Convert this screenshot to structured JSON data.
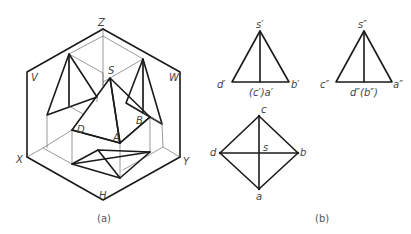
{
  "figure_a": {
    "caption": "(a)",
    "axis_labels": {
      "z": "Z",
      "x": "X",
      "y": "Y",
      "h": "H"
    },
    "plane_labels": {
      "v": "V",
      "w": "W"
    },
    "vertex_labels": {
      "s": "S",
      "a": "A",
      "b": "B",
      "d": "D"
    }
  },
  "figure_b": {
    "caption": "(b)",
    "front_view": {
      "apex": "s′",
      "left": "d′",
      "middle": "(c′)a′",
      "right": "b′"
    },
    "side_view": {
      "apex": "s″",
      "left": "c″",
      "middle": "d″(b″)",
      "right": "a″"
    },
    "top_view": {
      "top": "c",
      "left": "d",
      "center": "s",
      "right": "b",
      "bottom": "a"
    }
  }
}
